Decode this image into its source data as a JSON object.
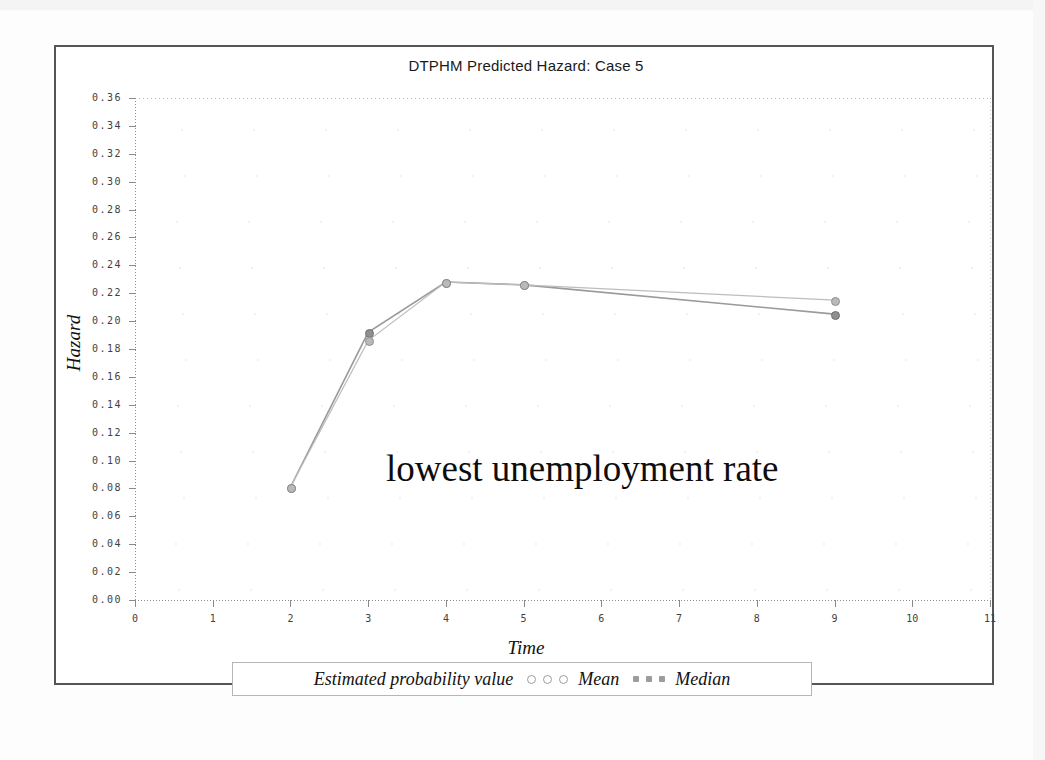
{
  "figure": {
    "title": "DTPHM Predicted Hazard: Case 5",
    "annotation": "lowest unemployment rate",
    "x_axis_title": "Time",
    "y_axis_title": "Hazard"
  },
  "legend": {
    "title": "Estimated probability value",
    "entries": [
      {
        "label": "Mean",
        "marker": "open-circle-line",
        "color": "#9c9c9c"
      },
      {
        "label": "Median",
        "marker": "solid-square-dots",
        "color": "#9c9c9c"
      }
    ]
  },
  "chart_data": {
    "type": "line",
    "title": "DTPHM Predicted Hazard: Case 5",
    "xlabel": "Time",
    "ylabel": "Hazard",
    "xlim": [
      0,
      11
    ],
    "ylim": [
      0.0,
      0.36
    ],
    "grid": false,
    "legend_position": "bottom",
    "xticks": [
      0,
      1,
      2,
      3,
      4,
      5,
      6,
      7,
      8,
      9,
      10,
      11
    ],
    "xtick_labels": [
      "0",
      "1",
      "2",
      "3",
      "4",
      "5",
      "6",
      "7",
      "8",
      "9",
      "10",
      "11"
    ],
    "yticks": [
      0.0,
      0.02,
      0.04,
      0.06,
      0.08,
      0.1,
      0.12,
      0.14,
      0.16,
      0.18,
      0.2,
      0.22,
      0.24,
      0.26,
      0.28,
      0.3,
      0.32,
      0.34,
      0.36
    ],
    "ytick_labels": [
      "0.00",
      "0.02",
      "0.04",
      "0.06",
      "0.08",
      "0.10",
      "0.12",
      "0.14",
      "0.16",
      "0.18",
      "0.20",
      "0.22",
      "0.24",
      "0.26",
      "0.28",
      "0.30",
      "0.32",
      "0.34",
      "0.36"
    ],
    "x": [
      2,
      3,
      4,
      5,
      9
    ],
    "series": [
      {
        "name": "Mean",
        "x": [
          2,
          3,
          4,
          5,
          9
        ],
        "values": [
          0.081,
          0.192,
          0.228,
          0.226,
          0.205
        ]
      },
      {
        "name": "Median",
        "x": [
          2,
          3,
          4,
          5,
          9
        ],
        "values": [
          0.081,
          0.186,
          0.228,
          0.226,
          0.215
        ]
      }
    ],
    "annotations": [
      {
        "text": "lowest unemployment rate",
        "x": 4.3,
        "y": 0.095
      }
    ]
  }
}
